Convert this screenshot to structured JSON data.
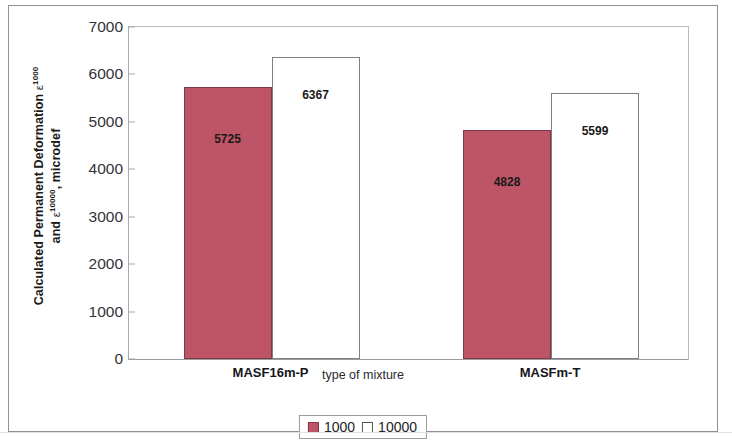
{
  "chart_data": {
    "type": "bar",
    "title": "",
    "subtitle": "",
    "xlabel": "type of mixture",
    "ylabel_line1_prefix": "Calculated Permanent Deformation ",
    "ylabel_line1_eps": "ε",
    "ylabel_line1_sup": "1000",
    "ylabel_line2_prefix": "and ",
    "ylabel_line2_eps": "ε",
    "ylabel_line2_sup": "10000",
    "ylabel_line2_suffix": ", microdef",
    "categories": [
      "MASF16m-P",
      "MASFm-T"
    ],
    "series": [
      {
        "name": "1000",
        "values": [
          5725,
          4828
        ],
        "color": "#bd5566"
      },
      {
        "name": "10000",
        "values": [
          6367,
          5599
        ],
        "color": "#ffffff"
      }
    ],
    "ylim": [
      0,
      7000
    ],
    "ytick_step": 1000,
    "yticks": [
      0,
      1000,
      2000,
      3000,
      4000,
      5000,
      6000,
      7000
    ],
    "ytick_labels": [
      "0",
      "1000",
      "2000",
      "3000",
      "4000",
      "5000",
      "6000",
      "7000"
    ],
    "grid": false,
    "legend_position": "bottom-center",
    "data_labels": [
      {
        "value": "5725",
        "series": "1000",
        "category": "MASF16m-P"
      },
      {
        "value": "6367",
        "series": "10000",
        "category": "MASF16m-P"
      },
      {
        "value": "4828",
        "series": "1000",
        "category": "MASFm-T"
      },
      {
        "value": "5599",
        "series": "10000",
        "category": "MASFm-T"
      }
    ]
  },
  "legend": {
    "items": [
      {
        "label": "1000",
        "swatch": "red-square-swatch"
      },
      {
        "label": "10000",
        "swatch": "white-square-swatch"
      }
    ]
  },
  "colors": {
    "bar_fill_1000": "#bd5566",
    "bar_border_1000": "#7d3a45",
    "bar_fill_10000": "#ffffff",
    "bar_border_10000": "#7f7f84",
    "axis": "#a9a9ae",
    "text": "#1a1a1a",
    "frame": "#8f8f94"
  }
}
